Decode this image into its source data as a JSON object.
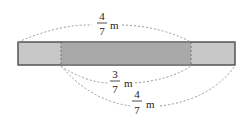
{
  "diagram": {
    "type": "fraction-length-bar",
    "colors": {
      "bar_light": "#c8c8c8",
      "bar_dark": "#a9a9a9",
      "outline": "#555555",
      "arc": "#999999",
      "text": "#222222"
    },
    "top_label": {
      "numerator": "4",
      "denominator": "7",
      "unit": "m"
    },
    "inner_label": {
      "numerator": "3",
      "denominator": "7",
      "unit": "m"
    },
    "bottom_label": {
      "numerator": "4",
      "denominator": "7",
      "unit": "m"
    }
  }
}
